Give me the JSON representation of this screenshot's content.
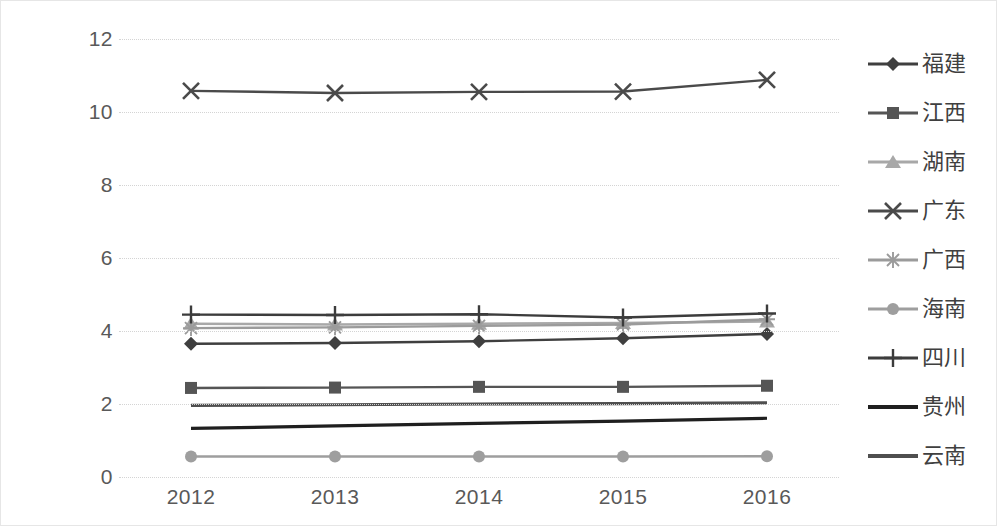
{
  "chart_data": {
    "type": "line",
    "title": "",
    "xlabel": "",
    "ylabel": "",
    "categories": [
      "2012",
      "2013",
      "2014",
      "2015",
      "2016"
    ],
    "ylim": [
      0,
      12
    ],
    "ytick_labels": [
      "0",
      "2",
      "4",
      "6",
      "8",
      "10",
      "12"
    ],
    "ytick_values": [
      0,
      2,
      4,
      6,
      8,
      10,
      12
    ],
    "grid": true,
    "legend_position": "right",
    "series": [
      {
        "name": "福建",
        "marker": "diamond",
        "color": "#3f3f3f",
        "values": [
          3.65,
          3.67,
          3.72,
          3.8,
          3.92
        ]
      },
      {
        "name": "江西",
        "marker": "square",
        "color": "#555555",
        "values": [
          2.44,
          2.45,
          2.47,
          2.47,
          2.5
        ]
      },
      {
        "name": "湖南",
        "marker": "triangle",
        "color": "#a8a8a8",
        "values": [
          4.2,
          4.18,
          4.2,
          4.22,
          4.26
        ]
      },
      {
        "name": "广东",
        "marker": "x",
        "color": "#4a4a4a",
        "values": [
          10.58,
          10.52,
          10.55,
          10.56,
          10.88
        ]
      },
      {
        "name": "广西",
        "marker": "asterisk",
        "color": "#9b9b9b",
        "values": [
          4.08,
          4.1,
          4.14,
          4.18,
          4.32
        ]
      },
      {
        "name": "海南",
        "marker": "circle",
        "color": "#9e9e9e",
        "values": [
          0.56,
          0.56,
          0.56,
          0.56,
          0.57
        ]
      },
      {
        "name": "四川",
        "marker": "plus",
        "color": "#3c3c3c",
        "values": [
          4.45,
          4.44,
          4.46,
          4.37,
          4.48
        ]
      },
      {
        "name": "贵州",
        "marker": "none",
        "color": "#1f1f1f",
        "values": [
          1.33,
          1.4,
          1.47,
          1.53,
          1.61
        ]
      },
      {
        "name": "云南",
        "marker": "none",
        "color": "#4f4f4f",
        "values": [
          1.96,
          1.98,
          2.0,
          2.01,
          2.03
        ]
      }
    ]
  },
  "legend": {
    "items": [
      {
        "label": "福建"
      },
      {
        "label": "江西"
      },
      {
        "label": "湖南"
      },
      {
        "label": "广东"
      },
      {
        "label": "广西"
      },
      {
        "label": "海南"
      },
      {
        "label": "四川"
      },
      {
        "label": "贵州"
      },
      {
        "label": "云南"
      }
    ]
  }
}
